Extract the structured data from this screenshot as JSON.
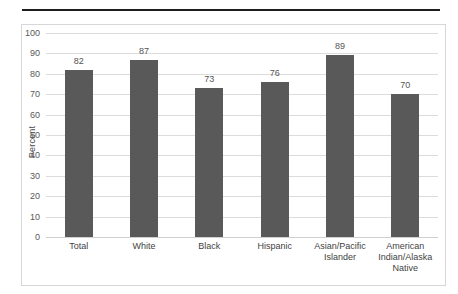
{
  "page": {
    "background_color": "#ffffff",
    "top_rule_color": "#1d1d1d",
    "frame_border_color": "#d7d7d7"
  },
  "chart_data": {
    "type": "bar",
    "title": "",
    "subtitle": "",
    "xlabel": "",
    "ylabel": "Percent",
    "ylim": [
      0,
      100
    ],
    "ytick_step": 10,
    "yticks": [
      0,
      10,
      20,
      30,
      40,
      50,
      60,
      70,
      80,
      90,
      100
    ],
    "grid": true,
    "legend": false,
    "legend_position": "none",
    "bar_color": "#595959",
    "gridline_color": "#dcdcdc",
    "value_label_color": "#555555",
    "categories": [
      "Total",
      "White",
      "Black",
      "Hispanic",
      "Asian/Pacific Islander",
      "American Indian/Alaska Native"
    ],
    "values": [
      82,
      87,
      73,
      76,
      89,
      70
    ],
    "data_labels": [
      "82",
      "87",
      "73",
      "76",
      "89",
      "70"
    ]
  }
}
